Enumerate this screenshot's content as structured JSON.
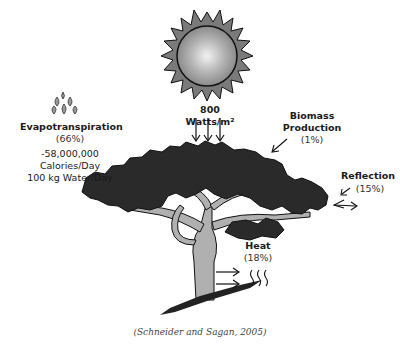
{
  "diagram": {
    "sun": {
      "label": "800 Watts/m²",
      "icon": "sun-icon"
    },
    "evapotranspiration": {
      "title": "Evapotranspiration",
      "percent": "(66%)",
      "calories": "-58,000,000 Calories/Day",
      "water": "100 kg Water/Day",
      "icon": "water-drops-icon"
    },
    "biomass": {
      "title_line1": "Biomass",
      "title_line2": "Production",
      "percent": "(1%)"
    },
    "reflection": {
      "title": "Reflection",
      "percent": "(15%)"
    },
    "heat": {
      "title": "Heat",
      "percent": "(18%)",
      "icon": "heat-waves-icon"
    },
    "caption": "(Schneider and Sagan, 2005)"
  },
  "colors": {
    "sun_fill": "#9a9a9a",
    "sun_highlight": "#e8e8e8",
    "canopy": "#2a2a2a",
    "trunk": "#b0b0b0",
    "outline": "#111111"
  }
}
